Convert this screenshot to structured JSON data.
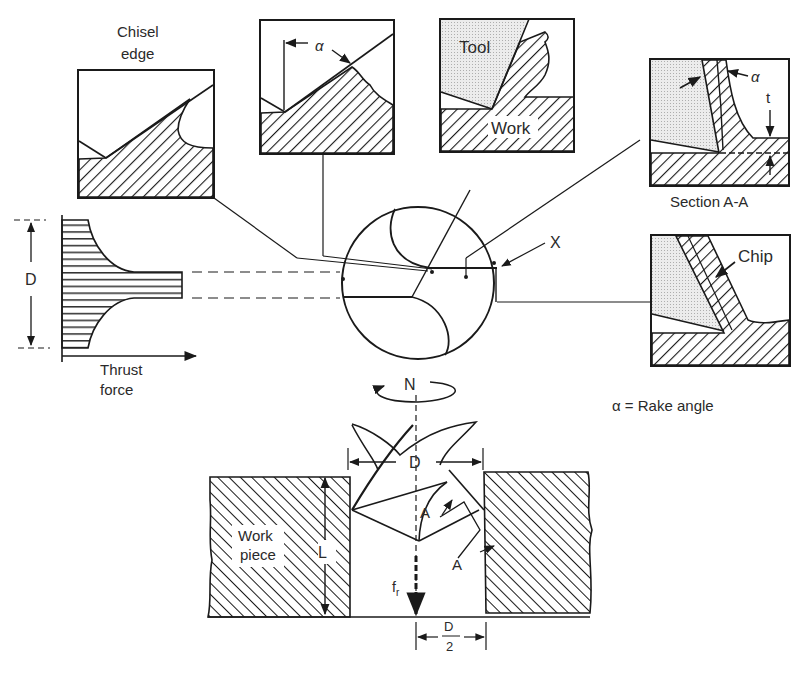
{
  "figure": {
    "type": "drilling-operation-diagram",
    "colors": {
      "ink": "#1a1a1a",
      "text": "#2a2a2a",
      "tool_fill": "#e6e6e6",
      "background": "#ffffff"
    }
  },
  "labels": {
    "chisel_edge_line1": "Chisel",
    "chisel_edge_line2": "edge",
    "alpha_inset": "α",
    "tool": "Tool",
    "work": "Work",
    "alpha_section": "α",
    "t": "t",
    "section_aa": "Section A-A",
    "chip": "Chip",
    "x_marker": "X",
    "d_thrust": "D",
    "thrust_line1": "Thrust",
    "thrust_line2": "force",
    "n_rotation": "N",
    "rake_legend": "α = Rake angle",
    "d_drill": "D",
    "work_piece_line1": "Work",
    "work_piece_line2": "piece",
    "l_depth": "L",
    "a_upper": "A",
    "a_lower": "A",
    "f_main": "f",
    "f_sub": "r",
    "d_half_num": "D",
    "d_half_den": "2"
  },
  "insets": [
    {
      "name": "chisel-edge-inset",
      "title": "Chisel edge"
    },
    {
      "name": "rake-angle-inset",
      "title": "α"
    },
    {
      "name": "tool-work-inset",
      "title": "Tool / Work"
    },
    {
      "name": "section-aa-inset",
      "title": "Section A-A"
    },
    {
      "name": "chip-inset",
      "title": "Chip"
    }
  ]
}
